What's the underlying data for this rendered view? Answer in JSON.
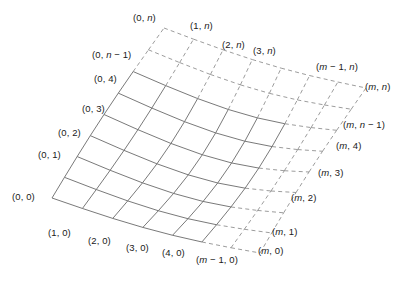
{
  "figure": {
    "type": "grid-mesh-diagram",
    "background_color": "#ffffff",
    "solid_line_color": "#6a6a6a",
    "dashed_line_color": "#8a8a8a",
    "text_color": "#1a1a1a"
  },
  "labels": [
    {
      "id": "v-0-n",
      "text": "(0, n)",
      "x": 133,
      "y": 13,
      "align": "left"
    },
    {
      "id": "v-1-n",
      "text": "(1, n)",
      "x": 190,
      "y": 21,
      "align": "left"
    },
    {
      "id": "v-2-n",
      "text": "(2, n)",
      "x": 222,
      "y": 40,
      "align": "left"
    },
    {
      "id": "v-3-n",
      "text": "(3, n)",
      "x": 253,
      "y": 46,
      "align": "left"
    },
    {
      "id": "v-m-1-n",
      "text": "(m − 1, n)",
      "x": 316,
      "y": 62,
      "align": "left"
    },
    {
      "id": "v-m-n",
      "text": "(m, n)",
      "x": 365,
      "y": 82,
      "align": "left"
    },
    {
      "id": "v-0-n-1",
      "text": "(0, n − 1)",
      "x": 92,
      "y": 50,
      "align": "left"
    },
    {
      "id": "v-0-4",
      "text": "(0, 4)",
      "x": 94,
      "y": 74,
      "align": "left"
    },
    {
      "id": "v-0-3",
      "text": "(0, 3)",
      "x": 82,
      "y": 104,
      "align": "left"
    },
    {
      "id": "v-0-2",
      "text": "(0, 2)",
      "x": 58,
      "y": 128,
      "align": "left"
    },
    {
      "id": "v-0-1",
      "text": "(0, 1)",
      "x": 38,
      "y": 150,
      "align": "left"
    },
    {
      "id": "v-0-0",
      "text": "(0, 0)",
      "x": 12,
      "y": 192,
      "align": "left"
    },
    {
      "id": "v-m-n-1",
      "text": "(m, n − 1)",
      "x": 343,
      "y": 120,
      "align": "left"
    },
    {
      "id": "v-m-4",
      "text": "(m, 4)",
      "x": 336,
      "y": 141,
      "align": "left"
    },
    {
      "id": "v-m-3",
      "text": "(m, 3)",
      "x": 318,
      "y": 168,
      "align": "left"
    },
    {
      "id": "v-m-2",
      "text": "(m, 2)",
      "x": 291,
      "y": 193,
      "align": "left"
    },
    {
      "id": "v-m-1",
      "text": "(m, 1)",
      "x": 272,
      "y": 227,
      "align": "left"
    },
    {
      "id": "v-m-0",
      "text": "(m, 0)",
      "x": 258,
      "y": 246,
      "align": "left"
    },
    {
      "id": "v-m-1-0",
      "text": "(m − 1, 0)",
      "x": 196,
      "y": 255,
      "align": "left"
    },
    {
      "id": "v-1-0",
      "text": "(1, 0)",
      "x": 48,
      "y": 228,
      "align": "left"
    },
    {
      "id": "v-2-0",
      "text": "(2, 0)",
      "x": 88,
      "y": 236,
      "align": "left"
    },
    {
      "id": "v-3-0",
      "text": "(3, 0)",
      "x": 126,
      "y": 243,
      "align": "left"
    },
    {
      "id": "v-4-0",
      "text": "(4, 0)",
      "x": 162,
      "y": 248,
      "align": "left"
    }
  ],
  "grid": {
    "solid_cols": 5,
    "solid_rows": 6,
    "total_cols": 7,
    "total_rows": 8,
    "corners": {
      "bottom_left": [
        52,
        198
      ],
      "top_left": [
        164,
        28
      ],
      "top_right": [
        363,
        88
      ],
      "bottom_right": [
        257,
        253
      ]
    }
  }
}
